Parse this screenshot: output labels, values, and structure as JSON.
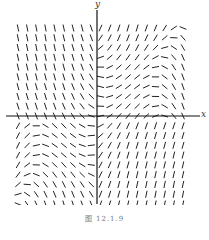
{
  "chart_data": {
    "type": "slope-field",
    "title": "",
    "xlabel": "x",
    "ylabel": "y",
    "caption": "图 12.1.9",
    "grid": false,
    "legend": null,
    "grid_points": {
      "cols": 19,
      "rows": 19
    },
    "axes": {
      "origin_px": [
        97,
        116
      ],
      "x_axis_extent_px": [
        8,
        200
      ],
      "y_axis_extent_px": [
        8,
        212
      ]
    }
  },
  "labels": {
    "x": "x",
    "y": "y",
    "caption": "图 12.1.9"
  },
  "style": {
    "segment_color": "#222222",
    "axis_color": "#111111"
  }
}
